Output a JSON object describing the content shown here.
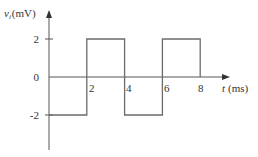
{
  "chart_data": {
    "type": "line",
    "title": "",
    "xlabel": "t (ms)",
    "ylabel": "v_i (mV)",
    "ylabel_parts": {
      "var": "v",
      "sub": "i",
      "unit": "(mV)"
    },
    "xlabel_parts": {
      "var": "t",
      "unit": "(ms)"
    },
    "x_ticks": [
      "2",
      "4",
      "6",
      "8"
    ],
    "y_ticks": [
      "2",
      "0",
      "-2"
    ],
    "xlim": [
      0,
      9.5
    ],
    "ylim": [
      -4,
      3.5
    ],
    "grid": false,
    "legend": null,
    "step_waveform": true,
    "x": [
      0,
      2,
      2,
      4,
      4,
      6,
      6,
      8,
      8
    ],
    "series": [
      {
        "name": "v_i",
        "values": [
          -2,
          -2,
          2,
          2,
          -2,
          -2,
          2,
          2,
          0
        ]
      }
    ],
    "segments": [
      {
        "t_start": 0,
        "t_end": 2,
        "value": -2
      },
      {
        "t_start": 2,
        "t_end": 4,
        "value": 2
      },
      {
        "t_start": 4,
        "t_end": 6,
        "value": -2
      },
      {
        "t_start": 6,
        "t_end": 8,
        "value": 2
      }
    ]
  },
  "colors": {
    "axis": "#555555",
    "waveform": "#6b6b6b",
    "text": "#333333"
  }
}
